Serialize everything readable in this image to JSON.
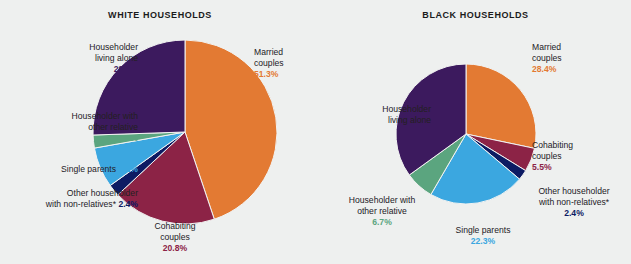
{
  "figure": {
    "background_color": "#eef0ef",
    "footnote_marker": "*"
  },
  "palette": {
    "married": "#E37A33",
    "cohabiting": "#8C2346",
    "other_nonrelatives": "#0D1B63",
    "single_parents": "#3BA7E0",
    "other_relative": "#5BA57F",
    "living_alone": "#3C1A5E"
  },
  "charts": [
    {
      "id": "white",
      "title": "WHITE HOUSEHOLDS",
      "labels": {
        "married": {
          "line1": "Married",
          "line2": "couples",
          "pct": "51.3%"
        },
        "cohabiting": {
          "line1": "Cohabiting",
          "line2": "couples",
          "pct": "20.8%"
        },
        "other_nonrelatives": {
          "line1": "Other householder",
          "line2": "with non-relatives*",
          "pct": "2.4%"
        },
        "single_parents": {
          "line1": "Single parents",
          "pct": "8.1%"
        },
        "other_relative": {
          "line1": "Householder with",
          "line2": "other relative",
          "pct": "2.6%"
        },
        "living_alone": {
          "line1": "Householder",
          "line2": "living alone",
          "pct": "29.2%"
        }
      }
    },
    {
      "id": "black",
      "title": "BLACK HOUSEHOLDS",
      "labels": {
        "married": {
          "line1": "Married",
          "line2": "couples",
          "pct": "28.4%"
        },
        "cohabiting": {
          "line1": "Cohabiting",
          "line2": "couples",
          "pct": "5.5%"
        },
        "other_nonrelatives": {
          "line1": "Other householder",
          "line2": "with non-relatives*",
          "pct": "2.4%"
        },
        "single_parents": {
          "line1": "Single parents",
          "pct": "22.3%"
        },
        "other_relative": {
          "line1": "Householder with",
          "line2": "other relative",
          "pct": "6.7%"
        },
        "living_alone": {
          "line1": "Householder",
          "line2": "living alone",
          "pct": "35.1%"
        }
      }
    }
  ],
  "chart_data": [
    {
      "type": "pie",
      "title": "WHITE HOUSEHOLDS",
      "categories": [
        "Married couples",
        "Cohabiting couples",
        "Other householder with non-relatives*",
        "Single parents",
        "Householder with other relative",
        "Householder living alone"
      ],
      "values": [
        51.3,
        20.8,
        2.4,
        8.1,
        2.6,
        29.2
      ],
      "value_labels": [
        "51.3%",
        "20.8%",
        "2.4%",
        "8.1%",
        "2.6%",
        "29.2%"
      ],
      "colors": [
        "#E37A33",
        "#8C2346",
        "#0D1B63",
        "#3BA7E0",
        "#5BA57F",
        "#3C1A5E"
      ],
      "units": "percent",
      "start_angle_deg": 0,
      "direction": "clockwise",
      "legend": "labels-outside",
      "note": "Slice percentages sum to 114.4 because the figure draws sectors on a normalized circle."
    },
    {
      "type": "pie",
      "title": "BLACK HOUSEHOLDS",
      "categories": [
        "Married couples",
        "Cohabiting couples",
        "Other householder with non-relatives*",
        "Single parents",
        "Householder with other relative",
        "Householder living alone"
      ],
      "values": [
        28.4,
        5.5,
        2.4,
        22.3,
        6.7,
        35.1
      ],
      "value_labels": [
        "28.4%",
        "5.5%",
        "2.4%",
        "22.3%",
        "6.7%",
        "35.1%"
      ],
      "colors": [
        "#E37A33",
        "#8C2346",
        "#0D1B63",
        "#3BA7E0",
        "#5BA57F",
        "#3C1A5E"
      ],
      "units": "percent",
      "start_angle_deg": 0,
      "direction": "clockwise",
      "legend": "labels-outside"
    }
  ]
}
